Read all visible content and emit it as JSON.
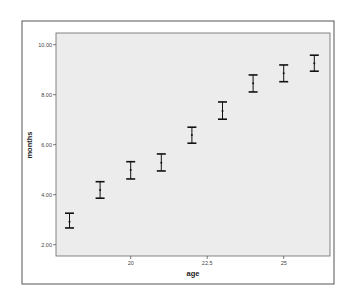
{
  "chart_data": {
    "type": "errorbar",
    "title": "",
    "xlabel": "age",
    "ylabel": "months",
    "xlim": [
      17.2,
      26.5
    ],
    "ylim": [
      1.55,
      10.45
    ],
    "x_ticks": [
      20,
      22.5,
      25
    ],
    "x_tick_labels": [
      "20",
      "22.5",
      "25"
    ],
    "y_ticks": [
      2,
      4,
      6,
      8,
      10
    ],
    "y_tick_labels": [
      "2.00",
      "4.00",
      "6.00",
      "8.00",
      "10.00"
    ],
    "grid": false,
    "legend": null,
    "series": [
      {
        "name": "months by age",
        "x": [
          18,
          19,
          20,
          21,
          22,
          23,
          24,
          25,
          26
        ],
        "mean": [
          2.92,
          4.19,
          4.99,
          5.28,
          6.39,
          7.35,
          8.46,
          8.86,
          9.26
        ],
        "upper": [
          3.26,
          4.52,
          5.32,
          5.63,
          6.7,
          7.71,
          8.79,
          9.19,
          9.58
        ],
        "lower": [
          2.67,
          3.86,
          4.63,
          4.95,
          6.06,
          7.02,
          8.11,
          8.52,
          8.94
        ]
      }
    ]
  },
  "colors": {
    "plot_background": "#ececec",
    "frame": "#555555",
    "bar": "#111111"
  }
}
